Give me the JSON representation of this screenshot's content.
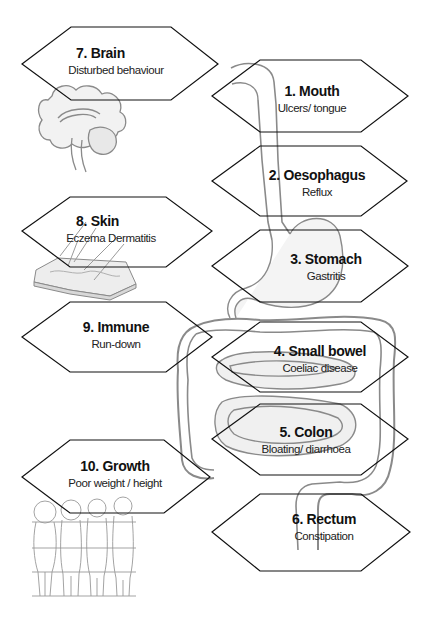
{
  "diagram": {
    "line_color": "#111111",
    "illustration_color": "#7a7a7a",
    "boxes": [
      {
        "id": 1,
        "title": "1. Mouth",
        "subtitle": "Ulcers/ tongue"
      },
      {
        "id": 2,
        "title": "2. Oesophagus",
        "subtitle": "Reflux"
      },
      {
        "id": 3,
        "title": "3. Stomach",
        "subtitle": "Gastritis"
      },
      {
        "id": 4,
        "title": "4. Small bowel",
        "subtitle": "Coeliac disease"
      },
      {
        "id": 5,
        "title": "5. Colon",
        "subtitle": "Bloating/ diarrhoea"
      },
      {
        "id": 6,
        "title": "6. Rectum",
        "subtitle": "Constipation"
      },
      {
        "id": 7,
        "title": "7. Brain",
        "subtitle": "Disturbed behaviour"
      },
      {
        "id": 8,
        "title": "8. Skin",
        "subtitle": "Eczema Dermatitis"
      },
      {
        "id": 9,
        "title": "9. Immune",
        "subtitle": "Run-down"
      },
      {
        "id": 10,
        "title": "10. Growth",
        "subtitle": "Poor weight / height"
      }
    ],
    "illustrations": [
      "brain-illustration",
      "skin-illustration",
      "digestive-tract-illustration",
      "children-growth-illustration"
    ]
  }
}
